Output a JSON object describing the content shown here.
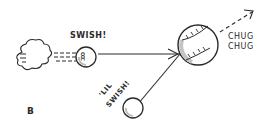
{
  "diagram": {
    "panel_label": "B",
    "labels": {
      "swish": "SWISH!",
      "lil_swish_line1": "'LIL",
      "lil_swish_line2": "SWISH!",
      "chug_line1": "CHUG",
      "chug_line2": "CHUG"
    },
    "ball_letters": "CCC",
    "colors": {
      "ink": "#2a2a2a",
      "background": "#ffffff",
      "shade": "#bdbdbd"
    }
  }
}
